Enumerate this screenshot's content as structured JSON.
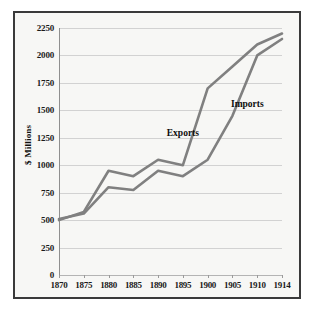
{
  "chart_data": {
    "type": "line",
    "title": "",
    "xlabel": "",
    "ylabel": "$ Millions",
    "categories": [
      "1870",
      "1875",
      "1880",
      "1885",
      "1890",
      "1895",
      "1900",
      "1905",
      "1910",
      "1914"
    ],
    "ylim": [
      0,
      2250
    ],
    "yticks": [
      0,
      250,
      500,
      750,
      1000,
      1250,
      1500,
      1750,
      2000,
      2250
    ],
    "ytick_labels": [
      "0",
      "250",
      "500",
      "750",
      "1000",
      "1250",
      "1500",
      "1750",
      "2000",
      "2250"
    ],
    "grid": true,
    "legend_position": "inline-annotations",
    "series": [
      {
        "name": "Exports",
        "values": [
          500,
          575,
          950,
          900,
          1050,
          1000,
          1700,
          1900,
          2100,
          2200
        ],
        "color": "#808080"
      },
      {
        "name": "Imports",
        "values": [
          510,
          560,
          800,
          775,
          950,
          900,
          1050,
          1450,
          2000,
          2150
        ],
        "color": "#808080"
      }
    ],
    "annotations": [
      {
        "text": "Exports",
        "x_value": "1895",
        "y_value": 1290
      },
      {
        "text": "Imports",
        "x_value": "1908",
        "y_value": 1560
      }
    ],
    "colors": {
      "line": "#808080",
      "grid": "#d2d2d2",
      "axis": "#8f8f8f",
      "frame_border": "#3a3a3a",
      "plot_background": "#f7f7f5",
      "page_background": "#ffffff",
      "text": "#1a1a1a"
    }
  }
}
